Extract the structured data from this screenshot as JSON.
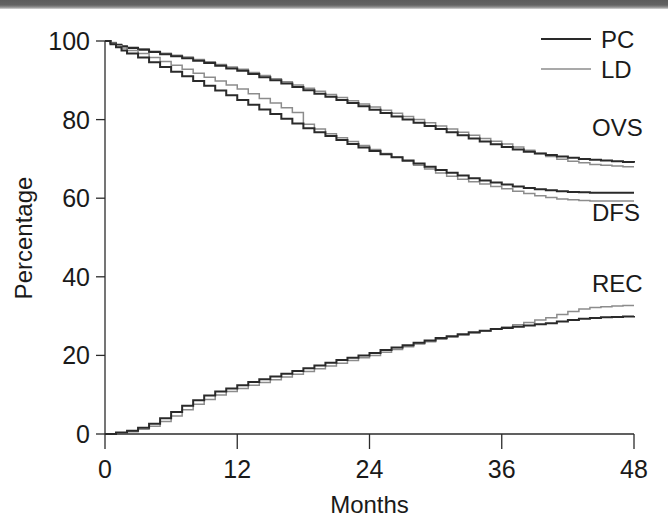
{
  "figure": {
    "background_color": "#ffffff",
    "scan_band_color": "#5c5c5c"
  },
  "chart_data": {
    "type": "line",
    "title": "",
    "subtitle": "",
    "xlabel": "Months",
    "ylabel": "Percentage",
    "xlim": [
      0,
      48
    ],
    "ylim": [
      0,
      100
    ],
    "xticks": [
      0,
      12,
      24,
      36,
      48
    ],
    "yticks": [
      0,
      20,
      40,
      60,
      80,
      100
    ],
    "xticklabels": [
      "0",
      "12",
      "24",
      "36",
      "48"
    ],
    "yticklabels": [
      "0",
      "20",
      "40",
      "60",
      "80",
      "100"
    ],
    "grid": false,
    "legend_position": "top-right",
    "legend": [
      {
        "name": "PC",
        "color": "#2a2a2a",
        "linewidth": 2.0
      },
      {
        "name": "LD",
        "color": "#8c8c8c",
        "linewidth": 1.5
      }
    ],
    "annotations": [
      {
        "text": "OVS",
        "x": 45.5,
        "y": 76,
        "desc": "overall-survival-curve-label"
      },
      {
        "text": "DFS",
        "x": 45.5,
        "y": 54,
        "desc": "disease-free-survival-curve-label"
      },
      {
        "text": "REC",
        "x": 45.5,
        "y": 36,
        "desc": "recurrence-curve-label"
      }
    ],
    "curve_style": "kaplan-meier-step",
    "groups": [
      {
        "label": "OVS",
        "description": "Overall survival, step curve, starts at 100% and declines",
        "series": [
          {
            "name": "PC",
            "color": "#2a2a2a",
            "x": [
              0,
              0.5,
              1,
              1.5,
              2,
              3,
              4,
              5,
              6,
              7,
              8,
              9,
              10,
              11,
              12,
              13,
              14,
              15,
              16,
              17,
              18,
              19,
              20,
              21,
              22,
              23,
              24,
              25,
              26,
              27,
              28,
              29,
              30,
              31,
              32,
              33,
              34,
              35,
              36,
              37,
              38,
              39,
              40,
              41,
              42,
              43,
              44,
              45,
              46,
              47,
              48
            ],
            "y": [
              100,
              99.4,
              99,
              98.6,
              98.2,
              97.8,
              97.2,
              96.6,
              96.1,
              95.6,
              95,
              94.4,
              93.7,
              93.0,
              92.4,
              91.6,
              90.8,
              90.0,
              89.2,
              88.3,
              87.5,
              86.6,
              85.8,
              85.0,
              84.2,
              83.4,
              82.5,
              81.7,
              80.8,
              80.0,
              79.2,
              78.4,
              77.6,
              76.8,
              76.0,
              75.2,
              74.4,
              73.7,
              73.0,
              72.4,
              71.8,
              71.4,
              71.0,
              70.6,
              70.3,
              70.0,
              69.8,
              69.6,
              69.4,
              69.2,
              69.0
            ]
          },
          {
            "name": "LD",
            "color": "#8c8c8c",
            "x": [
              0,
              0.5,
              1,
              1.5,
              2,
              3,
              4,
              5,
              6,
              7,
              8,
              9,
              10,
              11,
              12,
              13,
              14,
              15,
              16,
              17,
              18,
              19,
              20,
              21,
              22,
              23,
              24,
              25,
              26,
              27,
              28,
              29,
              30,
              31,
              32,
              33,
              34,
              35,
              36,
              37,
              38,
              39,
              40,
              41,
              42,
              43,
              44,
              45,
              46,
              47,
              48
            ],
            "y": [
              100,
              99.6,
              99.2,
              98.8,
              98.4,
              98.0,
              97.4,
              96.9,
              96.4,
              95.9,
              95.3,
              94.7,
              94.0,
              93.4,
              92.8,
              92.0,
              91.2,
              90.4,
              89.6,
              88.8,
              88.0,
              87.2,
              86.4,
              85.6,
              84.8,
              84.0,
              83.2,
              82.4,
              81.6,
              80.8,
              80.0,
              79.2,
              78.4,
              77.6,
              76.8,
              76.0,
              75.2,
              74.5,
              73.8,
              73.0,
              72.2,
              71.4,
              70.6,
              69.9,
              69.4,
              69.0,
              68.6,
              68.4,
              68.2,
              68.0,
              68.0
            ]
          }
        ]
      },
      {
        "label": "DFS",
        "description": "Disease-free survival, step curve, starts at 100% and declines",
        "series": [
          {
            "name": "PC",
            "color": "#2a2a2a",
            "x": [
              0,
              0.5,
              1,
              1.5,
              2,
              3,
              4,
              5,
              6,
              7,
              8,
              9,
              10,
              11,
              12,
              13,
              14,
              15,
              16,
              17,
              18,
              19,
              20,
              21,
              22,
              23,
              24,
              25,
              26,
              27,
              28,
              29,
              30,
              31,
              32,
              33,
              34,
              35,
              36,
              37,
              38,
              39,
              40,
              41,
              42,
              43,
              44,
              45,
              46,
              47,
              48
            ],
            "y": [
              100,
              99.2,
              98.4,
              97.6,
              96.8,
              95.8,
              94.6,
              93.4,
              92.2,
              91.0,
              89.8,
              88.6,
              87.4,
              86.2,
              85.0,
              83.8,
              82.6,
              81.4,
              80.2,
              79.0,
              77.8,
              76.8,
              75.8,
              74.8,
              73.8,
              72.9,
              72.0,
              71.2,
              70.4,
              69.6,
              68.8,
              68.0,
              67.2,
              66.5,
              65.8,
              65.1,
              64.5,
              64.0,
              63.5,
              63.0,
              62.6,
              62.3,
              62.0,
              61.8,
              61.6,
              61.5,
              61.4,
              61.4,
              61.4,
              61.4,
              61.4
            ]
          },
          {
            "name": "LD",
            "color": "#8c8c8c",
            "x": [
              0,
              0.5,
              1,
              1.5,
              2,
              3,
              4,
              5,
              6,
              7,
              8,
              9,
              10,
              11,
              12,
              13,
              14,
              15,
              16,
              17,
              18,
              19,
              20,
              21,
              22,
              23,
              24,
              25,
              26,
              27,
              28,
              29,
              30,
              31,
              32,
              33,
              34,
              35,
              36,
              37,
              38,
              39,
              40,
              41,
              42,
              43,
              44,
              45,
              46,
              47,
              48
            ],
            "y": [
              100,
              99.4,
              98.8,
              98.2,
              97.6,
              96.8,
              95.8,
              94.8,
              93.8,
              92.8,
              91.8,
              90.8,
              89.8,
              88.8,
              87.8,
              86.6,
              85.4,
              84.2,
              83.0,
              81.8,
              78.8,
              77.6,
              76.4,
              75.4,
              74.4,
              73.4,
              72.4,
              71.4,
              70.4,
              69.4,
              68.4,
              67.4,
              66.4,
              65.6,
              64.8,
              64.2,
              63.6,
              63.0,
              62.4,
              61.8,
              61.2,
              60.6,
              60.2,
              59.8,
              59.6,
              59.4,
              59.3,
              59.3,
              59.3,
              59.3,
              59.3
            ]
          }
        ]
      },
      {
        "label": "REC",
        "description": "Recurrence, step curve, starts at 0% and rises",
        "series": [
          {
            "name": "PC",
            "color": "#2a2a2a",
            "x": [
              0,
              1,
              2,
              3,
              4,
              5,
              6,
              7,
              8,
              9,
              10,
              11,
              12,
              13,
              14,
              15,
              16,
              17,
              18,
              19,
              20,
              21,
              22,
              23,
              24,
              25,
              26,
              27,
              28,
              29,
              30,
              31,
              32,
              33,
              34,
              35,
              36,
              37,
              38,
              39,
              40,
              41,
              42,
              43,
              44,
              45,
              46,
              47,
              48
            ],
            "y": [
              0,
              0.4,
              0.8,
              1.6,
              2.6,
              4.0,
              5.6,
              7.2,
              8.6,
              9.8,
              10.8,
              11.6,
              12.4,
              13.2,
              13.9,
              14.6,
              15.3,
              16.0,
              16.7,
              17.4,
              18.1,
              18.8,
              19.4,
              20.0,
              20.6,
              21.4,
              22.0,
              22.6,
              23.2,
              23.8,
              24.4,
              24.9,
              25.4,
              25.9,
              26.3,
              26.7,
              27.0,
              27.3,
              27.6,
              27.9,
              28.2,
              28.6,
              29.0,
              29.3,
              29.5,
              29.7,
              29.8,
              29.9,
              30.0
            ]
          },
          {
            "name": "LD",
            "color": "#8c8c8c",
            "x": [
              0,
              1,
              2,
              3,
              4,
              5,
              6,
              7,
              8,
              9,
              10,
              11,
              12,
              13,
              14,
              15,
              16,
              17,
              18,
              19,
              20,
              21,
              22,
              23,
              24,
              25,
              26,
              27,
              28,
              29,
              30,
              31,
              32,
              33,
              34,
              35,
              36,
              37,
              38,
              39,
              40,
              41,
              42,
              43,
              44,
              45,
              46,
              47,
              48
            ],
            "y": [
              0,
              0.3,
              0.6,
              1.2,
              2.0,
              3.2,
              4.6,
              6.2,
              7.6,
              8.8,
              9.9,
              10.8,
              11.6,
              12.4,
              13.1,
              13.8,
              14.5,
              15.2,
              15.9,
              16.6,
              17.3,
              18.0,
              18.7,
              19.4,
              20.0,
              20.8,
              21.5,
              22.2,
              22.9,
              23.5,
              24.1,
              24.7,
              25.2,
              25.7,
              26.2,
              26.7,
              27.2,
              27.8,
              28.4,
              29.0,
              29.6,
              30.4,
              31.2,
              31.8,
              32.2,
              32.4,
              32.6,
              32.7,
              32.7
            ]
          }
        ]
      }
    ]
  }
}
